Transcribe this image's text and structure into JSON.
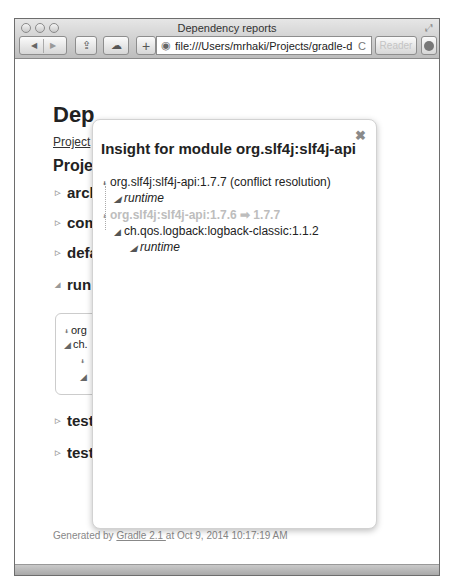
{
  "browser": {
    "window_title": "Dependency reports",
    "url": "file:///Users/mrhaki/Projects/gradle-d",
    "reader_label": "Reader",
    "add_label": "+",
    "back_icon": "◀",
    "forward_icon": "▶",
    "reload_icon": "C",
    "globe_icon": "◉",
    "share_icon": "⇪",
    "icloud_icon": "☁",
    "fullscreen_icon": "⤢"
  },
  "page": {
    "title": "Dep",
    "project_link": "Project",
    "section_title": "Proje",
    "configurations": [
      {
        "label": "arcl",
        "expanded": false
      },
      {
        "label": "com",
        "expanded": false
      },
      {
        "label": "defa",
        "expanded": false
      },
      {
        "label": "run",
        "expanded": true
      },
      {
        "label": "test",
        "expanded": false
      },
      {
        "label": "test",
        "expanded": false
      }
    ],
    "runtime_box": {
      "lines": [
        "org",
        "ch.",
        "",
        ""
      ]
    }
  },
  "modal": {
    "title": "Insight for module org.slf4j:slf4j-api",
    "close_icon": "✖",
    "tree": [
      {
        "text": "org.slf4j:slf4j-api:1.7.7 (conflict resolution)",
        "level": 0,
        "style": "normal"
      },
      {
        "text": "runtime",
        "level": 1,
        "style": "italic"
      },
      {
        "text": "org.slf4j:slf4j-api:1.7.6 ➡ 1.7.7",
        "level": 0,
        "style": "dim"
      },
      {
        "text": "ch.qos.logback:logback-classic:1.1.2",
        "level": 1,
        "style": "normal"
      },
      {
        "text": "runtime",
        "level": 2,
        "style": "italic"
      }
    ]
  },
  "footer": {
    "prefix": "Generated by ",
    "link": "Gradle 2.1 ",
    "suffix": "at Oct 9, 2014 10:17:19 AM"
  }
}
